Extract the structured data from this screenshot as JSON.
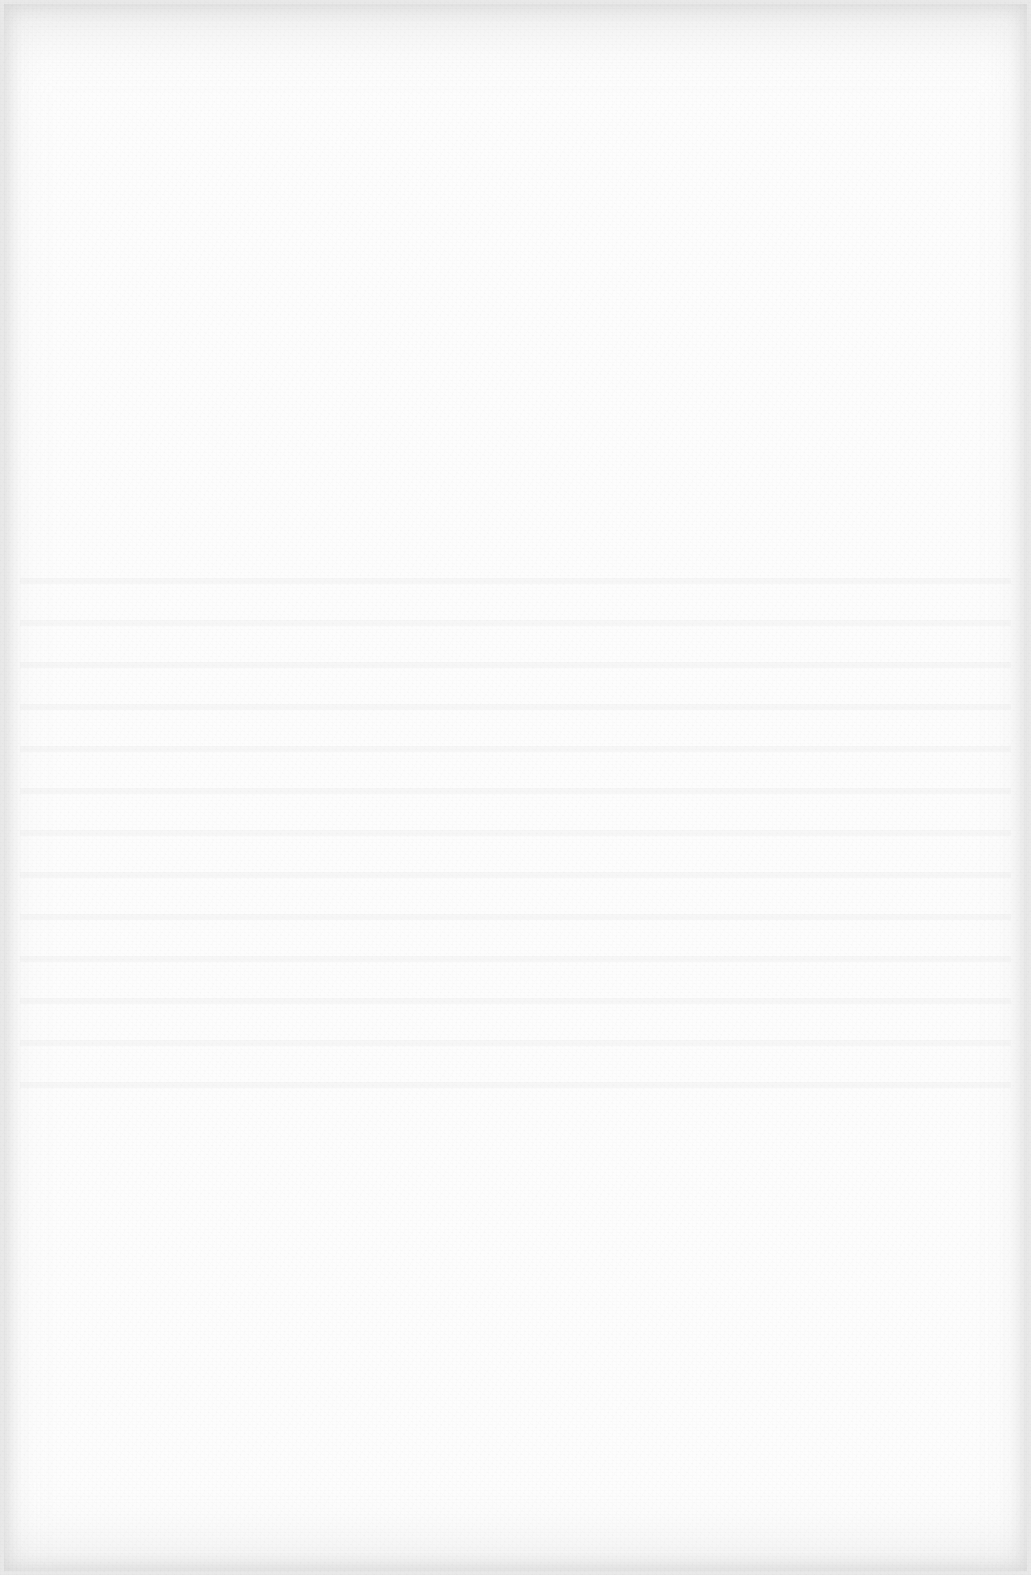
{
  "document": {
    "type": "blank-scanned-page",
    "background_color": "#fdfdfd",
    "edge_color": "#e9e9e9",
    "visible_text": ""
  }
}
